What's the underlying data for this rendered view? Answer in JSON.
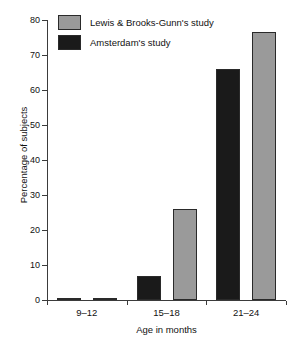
{
  "chart_data": {
    "type": "bar",
    "title": "",
    "subtitle": "",
    "xlabel": "Age in months",
    "ylabel": "Percentage of subjects",
    "categories": [
      "9–12",
      "15–18",
      "21–24"
    ],
    "series": [
      {
        "name": "Amsterdam's study",
        "color": "#1a1a1a",
        "values": [
          0.5,
          7,
          66
        ]
      },
      {
        "name": "Lewis & Brooks-Gunn's study",
        "color": "#9a9a9a",
        "values": [
          0.5,
          26,
          76.5
        ]
      }
    ],
    "ylim": [
      0,
      80
    ],
    "yticks": [
      0,
      10,
      20,
      30,
      40,
      50,
      60,
      70,
      80
    ],
    "ytick_labels": [
      "0",
      "10",
      "20",
      "30",
      "40",
      "50",
      "60",
      "70",
      "80"
    ],
    "grid": false,
    "legend_position": "upper-left-inside",
    "legend_entries": [
      {
        "label": "Lewis & Brooks-Gunn's study",
        "color": "#9a9a9a"
      },
      {
        "label": "Amsterdam's study",
        "color": "#1a1a1a"
      }
    ],
    "axis_color": "#3b3b3b",
    "bar_edge_color": "#2a2a2a",
    "background_color": "#ffffff"
  }
}
